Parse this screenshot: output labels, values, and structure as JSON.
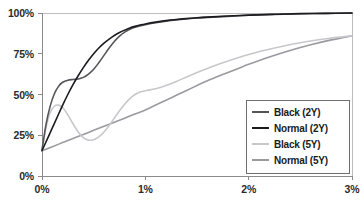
{
  "chart_data": {
    "type": "line",
    "title": "",
    "xlabel": "",
    "ylabel": "",
    "xlim": [
      0,
      3
    ],
    "ylim": [
      0,
      100
    ],
    "grid": false,
    "legend_position": "lower-right",
    "x_tick_labels": [
      "0%",
      "1%",
      "2%",
      "3%"
    ],
    "x_tick_values": [
      0,
      1,
      2,
      3
    ],
    "y_tick_labels": [
      "0%",
      "25%",
      "50%",
      "75%",
      "100%"
    ],
    "y_tick_values": [
      0,
      25,
      50,
      75,
      100
    ],
    "series": [
      {
        "name": "Black (2Y)",
        "color": "#55555a",
        "x": [
          0.0,
          0.04,
          0.08,
          0.12,
          0.16,
          0.2,
          0.25,
          0.3,
          0.35,
          0.4,
          0.45,
          0.5,
          0.55,
          0.6,
          0.65,
          0.7,
          0.75,
          0.8,
          0.85,
          0.9,
          1.0,
          1.1,
          1.2,
          1.3,
          1.4,
          1.5,
          1.6,
          1.75,
          2.0,
          2.25,
          2.5,
          2.75,
          3.0
        ],
        "y": [
          16.0,
          32.0,
          43.0,
          50.5,
          55.0,
          57.5,
          58.8,
          59.2,
          59.5,
          60.5,
          62.5,
          65.5,
          69.5,
          74.0,
          78.5,
          82.5,
          85.8,
          88.3,
          90.0,
          91.2,
          92.8,
          94.0,
          95.0,
          95.8,
          96.4,
          96.9,
          97.3,
          97.8,
          98.6,
          99.1,
          99.5,
          99.8,
          100.0
        ]
      },
      {
        "name": "Normal (2Y)",
        "color": "#1c1c20",
        "x": [
          0.0,
          0.05,
          0.1,
          0.15,
          0.2,
          0.25,
          0.3,
          0.35,
          0.4,
          0.45,
          0.5,
          0.55,
          0.6,
          0.65,
          0.7,
          0.75,
          0.8,
          0.85,
          0.9,
          0.95,
          1.0,
          1.1,
          1.2,
          1.3,
          1.4,
          1.5,
          1.6,
          1.75,
          2.0,
          2.25,
          2.5,
          2.75,
          3.0
        ],
        "y": [
          15.5,
          22.5,
          29.5,
          36.5,
          43.5,
          50.0,
          56.0,
          61.5,
          66.5,
          71.0,
          75.0,
          78.5,
          81.5,
          84.0,
          86.2,
          88.0,
          89.5,
          90.8,
          91.8,
          92.6,
          93.3,
          94.4,
          95.3,
          96.0,
          96.6,
          97.1,
          97.5,
          98.0,
          98.7,
          99.2,
          99.6,
          99.8,
          100.0
        ]
      },
      {
        "name": "Black (5Y)",
        "color": "#c8c8cc",
        "x": [
          0.0,
          0.04,
          0.08,
          0.12,
          0.16,
          0.2,
          0.25,
          0.3,
          0.35,
          0.4,
          0.45,
          0.5,
          0.55,
          0.6,
          0.65,
          0.7,
          0.75,
          0.8,
          0.85,
          0.9,
          0.95,
          1.0,
          1.1,
          1.2,
          1.3,
          1.4,
          1.5,
          1.6,
          1.75,
          2.0,
          2.25,
          2.5,
          2.75,
          3.0
        ],
        "y": [
          15.5,
          30.0,
          39.0,
          42.8,
          43.5,
          42.0,
          37.5,
          32.0,
          27.0,
          23.5,
          22.0,
          22.3,
          24.0,
          27.0,
          31.0,
          35.5,
          40.0,
          44.0,
          47.5,
          50.0,
          51.5,
          52.3,
          53.5,
          55.5,
          58.0,
          60.8,
          63.5,
          66.0,
          69.5,
          74.5,
          78.5,
          81.8,
          84.2,
          86.0
        ]
      },
      {
        "name": "Normal (5Y)",
        "color": "#9a9aa0",
        "x": [
          0.0,
          0.1,
          0.2,
          0.3,
          0.4,
          0.5,
          0.6,
          0.7,
          0.8,
          0.9,
          1.0,
          1.1,
          1.2,
          1.3,
          1.4,
          1.5,
          1.6,
          1.7,
          1.8,
          1.9,
          2.0,
          2.2,
          2.4,
          2.6,
          2.8,
          3.0
        ],
        "y": [
          15.5,
          18.0,
          20.5,
          23.0,
          25.5,
          28.0,
          30.5,
          33.0,
          35.5,
          38.0,
          40.5,
          43.5,
          46.5,
          49.5,
          52.5,
          55.5,
          58.5,
          61.0,
          63.5,
          66.0,
          68.5,
          73.0,
          77.0,
          80.5,
          83.5,
          86.0
        ]
      }
    ]
  },
  "axes": {
    "y_ticks": [
      {
        "label": "100%"
      },
      {
        "label": "75%"
      },
      {
        "label": "50%"
      },
      {
        "label": "25%"
      },
      {
        "label": "0%"
      }
    ],
    "x_ticks": [
      {
        "label": "0%"
      },
      {
        "label": "1%"
      },
      {
        "label": "2%"
      },
      {
        "label": "3%"
      }
    ]
  },
  "legend": {
    "items": [
      {
        "label": "Black (2Y)",
        "color": "#55555a"
      },
      {
        "label": "Normal (2Y)",
        "color": "#1c1c20"
      },
      {
        "label": "Black (5Y)",
        "color": "#c8c8cc"
      },
      {
        "label": "Normal (5Y)",
        "color": "#9a9aa0"
      }
    ]
  },
  "style": {
    "axis_color": "#8a8a8a",
    "top_gridline_color": "#bdbdbd",
    "legend_border_color": "#6e6e6e",
    "background": "#ffffff"
  }
}
